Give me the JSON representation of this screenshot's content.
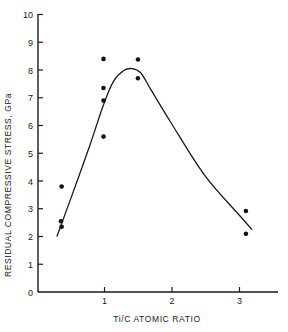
{
  "chart_data": {
    "type": "scatter",
    "title": "",
    "xlabel": "Ti/C ATOMIC RATIO",
    "ylabel": "RESIDUAL COMPRESSIVE STRESS, GPa",
    "xlim": [
      0,
      3.5
    ],
    "ylim": [
      0,
      10
    ],
    "x_ticks": [
      1,
      2,
      3
    ],
    "x_tick_labels": [
      "1",
      "2",
      "3"
    ],
    "y_ticks": [
      0,
      1,
      2,
      3,
      4,
      5,
      6,
      7,
      8,
      9,
      10
    ],
    "y_tick_labels": [
      "0",
      "1",
      "2",
      "3",
      "4",
      "5",
      "6",
      "7",
      "8",
      "9",
      "10"
    ],
    "grid": false,
    "legend": null,
    "series": [
      {
        "name": "measured",
        "kind": "scatter",
        "points": [
          {
            "x": 0.38,
            "y": 3.8
          },
          {
            "x": 0.37,
            "y": 2.55
          },
          {
            "x": 0.38,
            "y": 2.35
          },
          {
            "x": 1.0,
            "y": 8.4
          },
          {
            "x": 1.0,
            "y": 7.35
          },
          {
            "x": 1.0,
            "y": 6.9
          },
          {
            "x": 1.0,
            "y": 5.6
          },
          {
            "x": 1.51,
            "y": 8.38
          },
          {
            "x": 1.51,
            "y": 7.7
          },
          {
            "x": 3.11,
            "y": 2.92
          },
          {
            "x": 3.11,
            "y": 2.1
          }
        ]
      },
      {
        "name": "trend curve",
        "kind": "line",
        "points": [
          {
            "x": 0.31,
            "y": 2.0
          },
          {
            "x": 0.55,
            "y": 3.6
          },
          {
            "x": 0.8,
            "y": 5.3
          },
          {
            "x": 1.0,
            "y": 6.75
          },
          {
            "x": 1.15,
            "y": 7.6
          },
          {
            "x": 1.3,
            "y": 7.98
          },
          {
            "x": 1.42,
            "y": 8.05
          },
          {
            "x": 1.55,
            "y": 7.9
          },
          {
            "x": 1.7,
            "y": 7.3
          },
          {
            "x": 2.0,
            "y": 6.1
          },
          {
            "x": 2.5,
            "y": 4.2
          },
          {
            "x": 3.0,
            "y": 2.8
          },
          {
            "x": 3.2,
            "y": 2.25
          }
        ]
      }
    ]
  },
  "axes": {
    "x_title": "Ti/C ATOMIC RATIO",
    "y_title": "RESIDUAL COMPRESSIVE STRESS, GPa"
  }
}
